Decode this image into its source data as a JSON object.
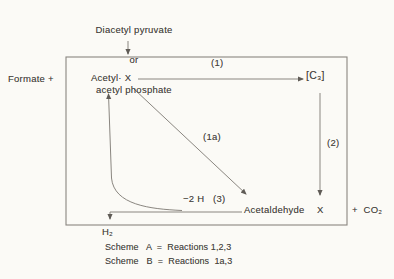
{
  "figure": {
    "source": {
      "line1": "Diacetyl pyruvate",
      "line2": "or",
      "line3": "acetyl phosphate"
    },
    "formate": "Formate +",
    "nodes": {
      "acetyl_x": "Acetyl· X",
      "c3": "[C₃]",
      "acetaldehyde": "Acetaldehyde",
      "x_product": "X",
      "h2": "H₂",
      "co2": "+  CO₂"
    },
    "reactions": {
      "r1": "(1)",
      "r1a": "(1a)",
      "r2": "(2)",
      "r3": "−2 H   (3)"
    },
    "captions": {
      "scheme_a": "Scheme   A  =  Reactions 1,2,3",
      "scheme_b": "Scheme   B  =  Reactions  1a,3"
    },
    "colors": {
      "background": "#fbfaf6",
      "line": "#8a8680",
      "line_dark": "#5f5b56",
      "text": "#474440"
    }
  }
}
